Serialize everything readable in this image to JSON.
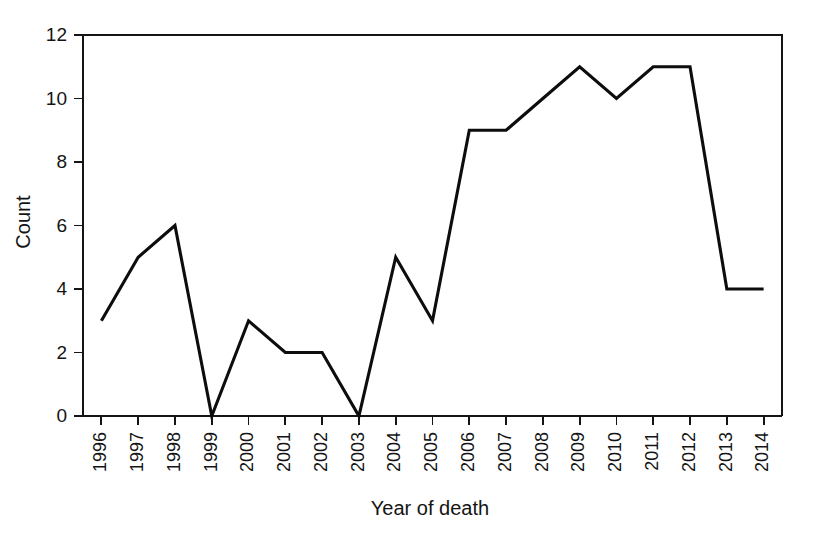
{
  "chart_data": {
    "type": "line",
    "title": "",
    "subtitle": "",
    "xlabel": "Year of death",
    "ylabel": "Count",
    "categories": [
      "1996",
      "1997",
      "1998",
      "1999",
      "2000",
      "2001",
      "2002",
      "2003",
      "2004",
      "2005",
      "2006",
      "2007",
      "2008",
      "2009",
      "2010",
      "2011",
      "2012",
      "2013",
      "2014"
    ],
    "values": [
      3,
      5,
      6,
      0,
      3,
      2,
      2,
      0,
      5,
      3,
      9,
      9,
      10,
      11,
      10,
      11,
      11,
      4,
      4
    ],
    "series": [
      {
        "name": "Count",
        "values": [
          3,
          5,
          6,
          0,
          3,
          2,
          2,
          0,
          5,
          3,
          9,
          9,
          10,
          11,
          10,
          11,
          11,
          4,
          4
        ],
        "color": "#0d0d0d"
      }
    ],
    "ylim": [
      0,
      12
    ],
    "yticks": [
      0,
      2,
      4,
      6,
      8,
      10,
      12
    ],
    "ytick_labels": [
      "0",
      "2",
      "4",
      "6",
      "8",
      "10",
      "12"
    ],
    "xtick_labels": [
      "1996",
      "1997",
      "1998",
      "1999",
      "2000",
      "2001",
      "2002",
      "2003",
      "2004",
      "2005",
      "2006",
      "2007",
      "2008",
      "2009",
      "2010",
      "2011",
      "2012",
      "2013",
      "2014"
    ],
    "xtick_rotation": 90,
    "grid": false,
    "legend": false,
    "legend_position": "none",
    "background_color": "#ffffff",
    "axis_color": "#151515",
    "line_color": "#0d0d0d"
  },
  "layout": {
    "plot_left": 83,
    "plot_right": 782,
    "plot_top": 35,
    "plot_bottom": 416
  }
}
